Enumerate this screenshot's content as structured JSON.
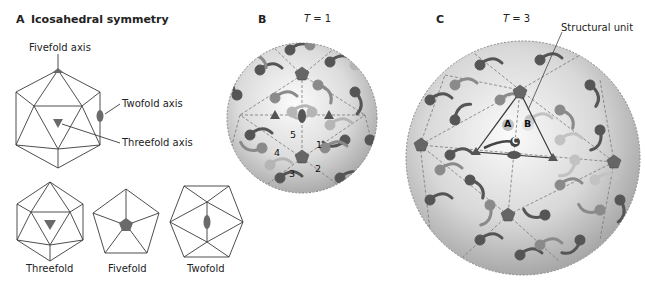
{
  "panel_a": {
    "letter": "A",
    "title": "Icosahedral symmetry",
    "labels": {
      "fivefold_axis": "Fivefold axis",
      "twofold_axis": "Twofold axis",
      "threefold_axis": "Threefold axis"
    },
    "views": [
      {
        "label": "Threefold"
      },
      {
        "label": "Fivefold"
      },
      {
        "label": "Twofold"
      }
    ]
  },
  "panel_b": {
    "letter": "B",
    "t_symbol": "T",
    "t_value": "= 1",
    "subunit_numbers": [
      "1",
      "2",
      "3",
      "4",
      "5"
    ]
  },
  "panel_c": {
    "letter": "C",
    "t_symbol": "T",
    "t_value": "= 3",
    "callout": "Structural unit",
    "subunit_labels": [
      "A",
      "B",
      "C"
    ]
  },
  "colors": {
    "line": "#3a3a3a",
    "symbol_fill": "#6a6a6a",
    "sphere_light": "#f2f2f2",
    "sphere_dark": "#9a9a9a",
    "subunit_dark": "#555555",
    "subunit_mid": "#888888",
    "subunit_light": "#b8b8b8"
  }
}
